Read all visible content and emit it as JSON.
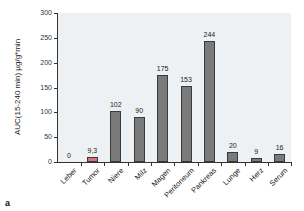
{
  "chart_data": {
    "type": "bar",
    "title": "",
    "panel_label": "a",
    "xlabel": "",
    "ylabel": "AUC(15-240 min) µg/g*min",
    "ylim": [
      0,
      300
    ],
    "yticks": [
      0,
      50,
      100,
      150,
      200,
      250,
      300
    ],
    "grid": false,
    "legend": null,
    "categories": [
      "Leber",
      "Tumor",
      "Niere",
      "Milz",
      "Magen",
      "Peritoneum",
      "Pankreas",
      "Lunge",
      "Herz",
      "Serum"
    ],
    "values": [
      0,
      9.3,
      102,
      90,
      175,
      153,
      244,
      20,
      9,
      16
    ],
    "value_labels": [
      "0",
      "9,3",
      "102",
      "90",
      "175",
      "153",
      "244",
      "20",
      "9",
      "16"
    ],
    "bar_colors": [
      "#7a7a7a",
      "#d9707e",
      "#7a7a7a",
      "#7a7a7a",
      "#7a7a7a",
      "#7a7a7a",
      "#7a7a7a",
      "#7a7a7a",
      "#7a7a7a",
      "#7a7a7a"
    ],
    "background_color": "#eef1f4"
  }
}
